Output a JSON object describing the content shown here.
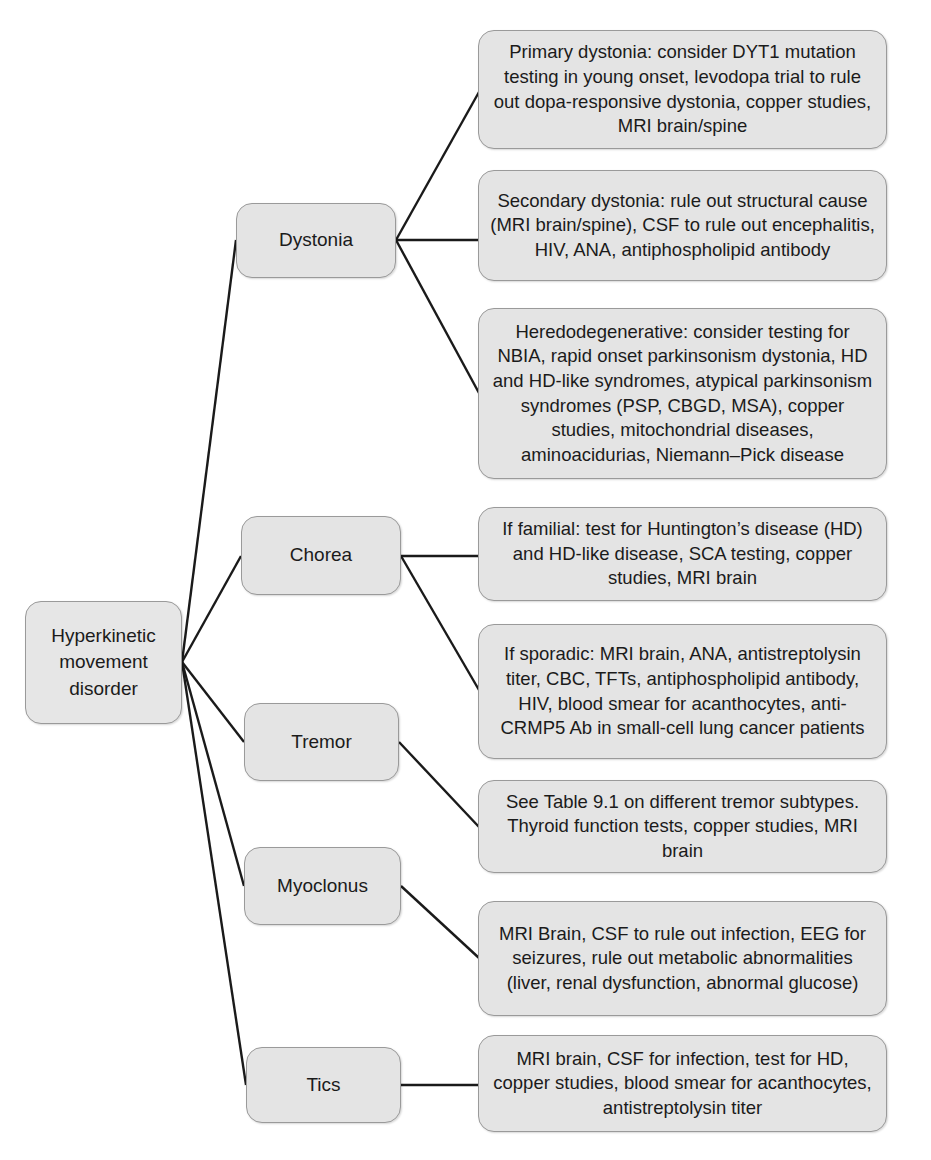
{
  "diagram": {
    "title": "Hyperkinetic movement disorder",
    "type": "tree-flowchart",
    "colors": {
      "node_fill": "#e3e3e3",
      "node_border": "#9a9a9a",
      "edge": "#1a1a1a",
      "text": "#1b1b1b",
      "background": "#ffffff"
    }
  },
  "root": {
    "label": "Hyperkinetic\nmovement\ndisorder"
  },
  "categories": [
    {
      "id": "dystonia",
      "label": "Dystonia"
    },
    {
      "id": "chorea",
      "label": "Chorea"
    },
    {
      "id": "tremor",
      "label": "Tremor"
    },
    {
      "id": "myoclonus",
      "label": "Myoclonus"
    },
    {
      "id": "tics",
      "label": "Tics"
    }
  ],
  "details": [
    {
      "id": "dystonia-primary",
      "parent": "dystonia",
      "text": "Primary dystonia: consider DYT1 mutation testing in young onset, levodopa trial to rule out dopa-responsive dystonia, copper studies, MRI brain/spine"
    },
    {
      "id": "dystonia-secondary",
      "parent": "dystonia",
      "text": "Secondary dystonia: rule out structural cause (MRI brain/spine), CSF to rule out encephalitis, HIV, ANA, antiphospholipid antibody"
    },
    {
      "id": "dystonia-heredodegenerative",
      "parent": "dystonia",
      "text": "Heredodegenerative: consider testing for NBIA, rapid onset parkinsonism dystonia, HD and HD-like syndromes, atypical parkinsonism syndromes (PSP, CBGD, MSA), copper studies, mitochondrial diseases, aminoacidurias, Niemann–Pick disease"
    },
    {
      "id": "chorea-familial",
      "parent": "chorea",
      "text": "If familial: test for Huntington’s disease (HD) and HD-like disease, SCA testing, copper studies, MRI brain"
    },
    {
      "id": "chorea-sporadic",
      "parent": "chorea",
      "text": "If sporadic: MRI brain, ANA, antistreptolysin titer, CBC, TFTs, antiphospholipid antibody, HIV, blood smear for acanthocytes, anti-CRMP5 Ab in small-cell lung cancer patients"
    },
    {
      "id": "tremor-workup",
      "parent": "tremor",
      "text": "See Table 9.1 on different tremor subtypes. Thyroid function tests, copper studies, MRI brain"
    },
    {
      "id": "myoclonus-workup",
      "parent": "myoclonus",
      "text": "MRI Brain, CSF to rule out infection, EEG for seizures, rule out metabolic abnormalities (liver, renal dysfunction, abnormal glucose)"
    },
    {
      "id": "tics-workup",
      "parent": "tics",
      "text": "MRI brain, CSF for infection, test for HD, copper studies, blood smear for acanthocytes, antistreptolysin titer"
    }
  ]
}
